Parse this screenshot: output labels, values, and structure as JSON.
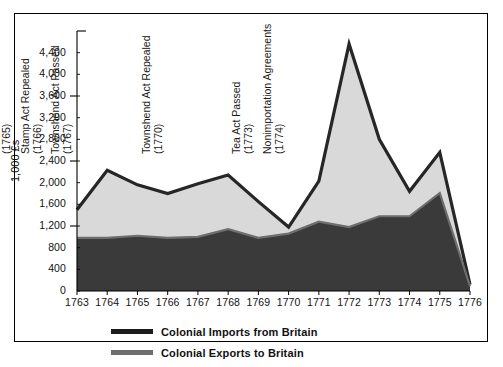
{
  "chart_data": {
    "type": "area",
    "title": "",
    "subtitle": "",
    "xlabel": "",
    "ylabel": "1,000 £s",
    "xlim": [
      1763,
      1776
    ],
    "ylim": [
      0,
      4800
    ],
    "grid": false,
    "legend_position": "bottom-left",
    "x": [
      1763,
      1764,
      1765,
      1766,
      1767,
      1768,
      1769,
      1770,
      1771,
      1772,
      1773,
      1774,
      1775,
      1776
    ],
    "xtick_labels": [
      "1763",
      "1764",
      "1765",
      "1766",
      "1767",
      "1768",
      "1769",
      "1770",
      "1771",
      "1772",
      "1773",
      "1774",
      "1775",
      "1776"
    ],
    "ytick_values": [
      0,
      400,
      800,
      1200,
      1600,
      2000,
      2400,
      2800,
      3200,
      3600,
      4000,
      4400
    ],
    "ytick_labels": [
      "0",
      "400",
      "800",
      "1,200",
      "1,600",
      "2,000",
      "2,400",
      "2,800",
      "3,200",
      "3,600",
      "4,000",
      "4,400"
    ],
    "series": [
      {
        "name": "Colonial Imports from Britain",
        "color": "#2b2b2b",
        "fill": "#d9d9d9",
        "values": [
          1500,
          2230,
          1960,
          1800,
          1980,
          2140,
          1650,
          1180,
          2030,
          4560,
          2800,
          1840,
          2560,
          120
        ]
      },
      {
        "name": "Colonial Exports to Britain",
        "color": "#6b6b6b",
        "fill": "#3a3a3a",
        "values": [
          980,
          980,
          1020,
          980,
          1000,
          1140,
          980,
          1060,
          1280,
          1180,
          1380,
          1380,
          1810,
          90
        ]
      }
    ],
    "annotations": [
      {
        "label": "Stamp Act Passed",
        "year": "(1765)",
        "x": 1765
      },
      {
        "label": "Stamp Act Repealed",
        "year": "(1766)",
        "x": 1766
      },
      {
        "label": "Townshend Act Passed",
        "year": "(1767)",
        "x": 1767
      },
      {
        "label": "Townshend Act Repealed",
        "year": "(1770)",
        "x": 1770
      },
      {
        "label": "Tea Act Passed",
        "year": "(1773)",
        "x": 1773
      },
      {
        "label": "Nonimportation Agreements",
        "year": "(1774)",
        "x": 1774
      }
    ]
  },
  "legend": {
    "items": [
      {
        "label": "Colonial Imports from Britain",
        "swatch_color": "#1c1c1c"
      },
      {
        "label": "Colonial Exports to Britain",
        "swatch_color": "#6e6e6e"
      }
    ]
  },
  "axis": {
    "y_title": "1,000 £s"
  }
}
